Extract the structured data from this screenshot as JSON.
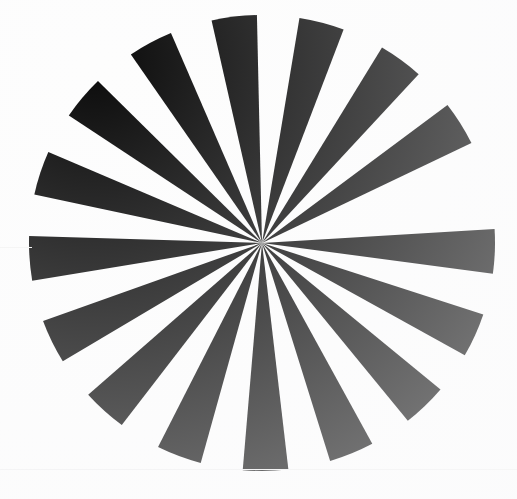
{
  "image": {
    "title": "Radial Starburst Test Pattern",
    "subject": "sunburst-wedge-resolution-target",
    "width": 517,
    "height": 499,
    "background_color": "#fdfdfd",
    "ink_color": "#0a0a0a",
    "medium_note": "scanned print, faint horizontal scan artifacts"
  },
  "chart_data": {
    "type": "pie",
    "subtitle": "16 black wedges alternating with 16 white gaps",
    "xlabel": "",
    "ylabel": "",
    "center_x": 262,
    "center_y": 243,
    "radius_x": 233,
    "radius_y": 228,
    "sector_count": 32,
    "wedge_count": 16,
    "gap_count": 16,
    "sector_angle_deg": 11.25,
    "rotation_offset_deg": -3.5,
    "grid": false,
    "legend_position": "none",
    "categories": [
      "wedge-01",
      "gap-01",
      "wedge-02",
      "gap-02",
      "wedge-03",
      "gap-03",
      "wedge-04",
      "gap-04",
      "wedge-05",
      "gap-05",
      "wedge-06",
      "gap-06",
      "wedge-07",
      "gap-07",
      "wedge-08",
      "gap-08",
      "wedge-09",
      "gap-09",
      "wedge-10",
      "gap-10",
      "wedge-11",
      "gap-11",
      "wedge-12",
      "gap-12",
      "wedge-13",
      "gap-13",
      "wedge-14",
      "gap-14",
      "wedge-15",
      "gap-15",
      "wedge-16",
      "gap-16"
    ],
    "values": [
      11.25,
      11.25,
      11.25,
      11.25,
      11.25,
      11.25,
      11.25,
      11.25,
      11.25,
      11.25,
      11.25,
      11.25,
      11.25,
      11.25,
      11.25,
      11.25,
      11.25,
      11.25,
      11.25,
      11.25,
      11.25,
      11.25,
      11.25,
      11.25,
      11.25,
      11.25,
      11.25,
      11.25,
      11.25,
      11.25,
      11.25,
      11.25
    ],
    "colors": [
      "#0a0a0a",
      "#fdfdfd",
      "#0a0a0a",
      "#fdfdfd",
      "#0a0a0a",
      "#fdfdfd",
      "#0a0a0a",
      "#fdfdfd",
      "#0a0a0a",
      "#fdfdfd",
      "#0a0a0a",
      "#fdfdfd",
      "#0a0a0a",
      "#fdfdfd",
      "#0a0a0a",
      "#fdfdfd",
      "#0a0a0a",
      "#fdfdfd",
      "#0a0a0a",
      "#fdfdfd",
      "#0a0a0a",
      "#fdfdfd",
      "#0a0a0a",
      "#fdfdfd",
      "#0a0a0a",
      "#fdfdfd",
      "#0a0a0a",
      "#fdfdfd",
      "#0a0a0a",
      "#fdfdfd",
      "#0a0a0a",
      "#fdfdfd"
    ],
    "wedges": [
      {
        "name": "wedge-01",
        "start_deg": -3.5,
        "end_deg": 7.75,
        "color": "#0a0a0a"
      },
      {
        "name": "wedge-02",
        "start_deg": 18.25,
        "end_deg": 29.5,
        "color": "#0a0a0a"
      },
      {
        "name": "wedge-03",
        "start_deg": 40.0,
        "end_deg": 51.25,
        "color": "#0a0a0a"
      },
      {
        "name": "wedge-04",
        "start_deg": 61.75,
        "end_deg": 73.0,
        "color": "#0a0a0a"
      },
      {
        "name": "wedge-05",
        "start_deg": 83.5,
        "end_deg": 94.75,
        "color": "#0a0a0a"
      },
      {
        "name": "wedge-06",
        "start_deg": 105.25,
        "end_deg": 116.5,
        "color": "#0a0a0a"
      },
      {
        "name": "wedge-07",
        "start_deg": 127.0,
        "end_deg": 138.25,
        "color": "#0a0a0a"
      },
      {
        "name": "wedge-08",
        "start_deg": 148.75,
        "end_deg": 160.0,
        "color": "#0a0a0a"
      },
      {
        "name": "wedge-09",
        "start_deg": 170.5,
        "end_deg": 181.75,
        "color": "#0a0a0a"
      },
      {
        "name": "wedge-10",
        "start_deg": 192.25,
        "end_deg": 203.5,
        "color": "#0a0a0a"
      },
      {
        "name": "wedge-11",
        "start_deg": 214.0,
        "end_deg": 225.25,
        "color": "#0a0a0a"
      },
      {
        "name": "wedge-12",
        "start_deg": 235.75,
        "end_deg": 247.0,
        "color": "#0a0a0a"
      },
      {
        "name": "wedge-13",
        "start_deg": 257.5,
        "end_deg": 268.75,
        "color": "#0a0a0a"
      },
      {
        "name": "wedge-14",
        "start_deg": 279.25,
        "end_deg": 290.5,
        "color": "#0a0a0a"
      },
      {
        "name": "wedge-15",
        "start_deg": 301.0,
        "end_deg": 312.25,
        "color": "#0a0a0a"
      },
      {
        "name": "wedge-16",
        "start_deg": 322.75,
        "end_deg": 334.0,
        "color": "#0a0a0a"
      }
    ]
  }
}
